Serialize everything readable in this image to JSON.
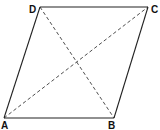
{
  "diagram": {
    "type": "parallelogram-with-diagonals",
    "vertices": [
      {
        "label": "A",
        "x": 4,
        "y": 118,
        "label_x": 1,
        "label_y": 129
      },
      {
        "label": "B",
        "x": 114,
        "y": 118,
        "label_x": 108,
        "label_y": 129
      },
      {
        "label": "C",
        "x": 148,
        "y": 7,
        "label_x": 151,
        "label_y": 13
      },
      {
        "label": "D",
        "x": 40,
        "y": 7,
        "label_x": 29,
        "label_y": 13
      }
    ],
    "edges": [
      {
        "from": "A",
        "to": "B",
        "style": "solid"
      },
      {
        "from": "B",
        "to": "C",
        "style": "solid"
      },
      {
        "from": "C",
        "to": "D",
        "style": "solid"
      },
      {
        "from": "D",
        "to": "A",
        "style": "solid"
      }
    ],
    "diagonals": [
      {
        "from": "A",
        "to": "C",
        "style": "dashed"
      },
      {
        "from": "D",
        "to": "B",
        "style": "dashed"
      }
    ],
    "colors": {
      "stroke": "#222222",
      "background": "#ffffff"
    }
  }
}
